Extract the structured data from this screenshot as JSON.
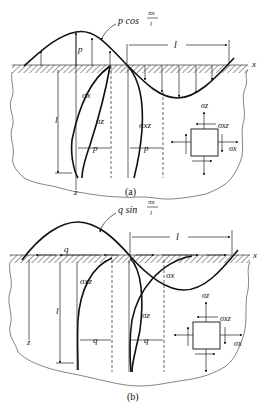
{
  "figure": {
    "panel_a": {
      "caption": "(a)",
      "load_label_prefix": "p cos",
      "load_fraction_num": "πx",
      "load_fraction_den": "l",
      "amplitude_label": "p",
      "wavelength_label": "l",
      "depth_label": "l",
      "axis_x": "x",
      "axis_z": "z",
      "curve_labels": [
        "σx",
        "σz",
        "σxz"
      ],
      "scale_labels": [
        "p",
        "p"
      ],
      "element_labels": {
        "top": "σz",
        "shear": "σxz",
        "right": "σx"
      }
    },
    "panel_b": {
      "caption": "(b)",
      "load_label_prefix": "q sin",
      "load_fraction_num": "πx",
      "load_fraction_den": "l",
      "amplitude_label": "q",
      "wavelength_label": "l",
      "depth_label": "l",
      "axis_x": "x",
      "axis_z": "z",
      "curve_labels": [
        "σxz",
        "σx",
        "σz"
      ],
      "scale_labels": [
        "q",
        "q"
      ],
      "element_labels": {
        "top": "σz",
        "shear": "σxz",
        "right": "σx"
      }
    }
  }
}
